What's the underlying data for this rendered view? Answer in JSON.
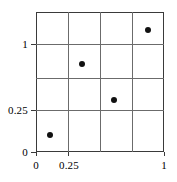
{
  "chart_data": {
    "type": "scatter",
    "title": "",
    "subtitle": "",
    "xlabel": "",
    "ylabel": "",
    "xlim": [
      0,
      1
    ],
    "ylim": [
      0,
      1.25
    ],
    "grid": true,
    "legend": null,
    "x_tick_labels": [
      "0",
      "0.25",
      "1"
    ],
    "y_tick_labels": [
      "0",
      "0.25",
      "1"
    ],
    "x_tick_values": [
      0,
      0.25,
      1
    ],
    "y_tick_values": [
      0,
      0.25,
      1
    ],
    "x_gridline_values": [
      0.25,
      0.5,
      0.75
    ],
    "y_gridline_values": [
      0.25,
      0.5,
      1
    ],
    "marker": "filled-circle",
    "marker_color": "#111111",
    "grid_color": "#6b6b6b",
    "frame_color": "#3a3a3a",
    "points": [
      {
        "x": 0.11,
        "y": 0.12
      },
      {
        "x": 0.36,
        "y": 0.63
      },
      {
        "x": 0.61,
        "y": 0.37
      },
      {
        "x": 0.87,
        "y": 0.87
      }
    ]
  },
  "axes": {
    "y_ticks": [
      {
        "label": "1",
        "pos_px": 44
      },
      {
        "label": "0.25",
        "pos_px": 110
      },
      {
        "label": "0",
        "pos_px": 152
      }
    ],
    "x_ticks": [
      {
        "label": "0",
        "pos_px": 36
      },
      {
        "label": "0.25",
        "pos_px": 68
      },
      {
        "label": "1",
        "pos_px": 164
      }
    ],
    "v_gridlines_px": [
      68,
      100,
      132
    ],
    "h_gridlines_px": [
      44,
      78,
      110
    ]
  },
  "points_px": [
    {
      "x": 50,
      "y": 135
    },
    {
      "x": 82,
      "y": 64
    },
    {
      "x": 114,
      "y": 100
    },
    {
      "x": 148,
      "y": 30
    }
  ]
}
